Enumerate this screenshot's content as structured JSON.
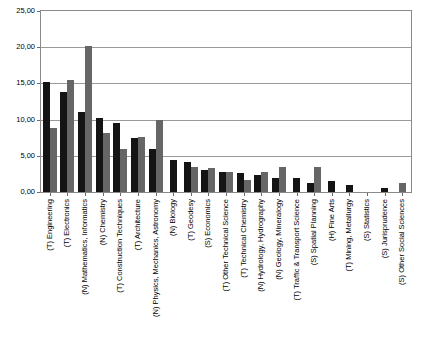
{
  "chart_data": {
    "type": "bar",
    "title": "",
    "xlabel": "",
    "ylabel": "",
    "ylim": [
      0,
      25
    ],
    "ytick_labels": [
      "25,00",
      "20,00",
      "15,00",
      "10,00",
      "5,00",
      "0,00"
    ],
    "ytick_values": [
      25,
      20,
      15,
      10,
      5,
      0
    ],
    "grid": true,
    "legend": "none",
    "decimal_separator": ",",
    "categories": [
      "(T) Engineering",
      "(T) Electronics",
      "(N) Mathematics, Informatics",
      "(N) Chemistry",
      "(T) Construction Techniques",
      "(T) Architecture",
      "(N) Physics, Mechanics, Astronomy",
      "(N) Biology",
      "(T) Geodesy",
      "(S) Economics",
      "(T) Other Technical Science",
      "(T) Technical Chemistry",
      "(N) Hydrology, Hydrography",
      "(N) Geology, Mineralogy",
      "(T) Traffic & Transport Science",
      "(S) Spatial Planning",
      "(H) Fine Arts",
      "(T) Mining, Metallurgy",
      "(S) Statistics",
      "(S) Jurisprudence",
      "(S) Other Social Sciences"
    ],
    "series": [
      {
        "name": "Series 1",
        "color": "#141414",
        "values": [
          15.2,
          13.8,
          11.0,
          10.2,
          9.5,
          7.4,
          6.0,
          4.4,
          4.1,
          3.1,
          2.8,
          2.6,
          2.4,
          2.0,
          1.9,
          1.3,
          1.5,
          1.0,
          0.0,
          0.6,
          0.0
        ]
      },
      {
        "name": "Series 2",
        "color": "#666666",
        "values": [
          8.9,
          15.5,
          20.2,
          8.1,
          6.0,
          7.6,
          9.9,
          0.0,
          3.5,
          3.3,
          2.7,
          1.7,
          2.7,
          3.5,
          0.0,
          3.4,
          0.0,
          0.0,
          0.0,
          0.0,
          1.3
        ]
      }
    ]
  },
  "top_sliver_text": ""
}
